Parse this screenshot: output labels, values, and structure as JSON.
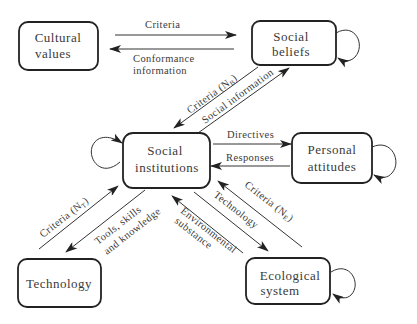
{
  "diagram": {
    "type": "flow-diagram",
    "nodes": {
      "cultural_values": {
        "line1": "Cultural",
        "line2": "values"
      },
      "social_beliefs": {
        "line1": "Social",
        "line2": "beliefs"
      },
      "social_institutions": {
        "line1": "Social",
        "line2": "institutions"
      },
      "personal_attitudes": {
        "line1": "Personal",
        "line2": "attitudes"
      },
      "technology": {
        "line1": "Technology"
      },
      "ecological_system": {
        "line1": "Ecological",
        "line2": "system"
      }
    },
    "edges": {
      "criteria_top": "Criteria",
      "conformance_1": "Conformance",
      "conformance_2": "information",
      "criteria_nb": "Criteria (N",
      "criteria_nb_sub": "B",
      "criteria_nb_close": ")",
      "social_information": "Social information",
      "directives": "Directives",
      "responses": "Responses",
      "criteria_nt": "Criteria (N",
      "criteria_nt_sub": "T",
      "criteria_nt_close": ")",
      "tools_1": "Tools, skills",
      "tools_2": "and knowledge",
      "criteria_ne": "Criteria (N",
      "criteria_ne_sub": "E",
      "criteria_ne_close": ")",
      "technology_edge": "Technology",
      "environmental_1": "Environmental",
      "environmental_2": "substance"
    },
    "colors": {
      "stroke": "#222222",
      "text": "#3a3a3a",
      "background": "#ffffff"
    }
  }
}
